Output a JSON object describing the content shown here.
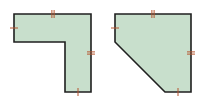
{
  "diagram": {
    "type": "geometry-figures",
    "colors": {
      "fill": "#c8dfcc",
      "stroke": "#1f1f1f",
      "tick": "#b5552e",
      "background": "#ffffff"
    },
    "shapes": [
      {
        "name": "l-shape",
        "points": [
          [
            14,
            14
          ],
          [
            91,
            14
          ],
          [
            91,
            92
          ],
          [
            65,
            92
          ],
          [
            65,
            42
          ],
          [
            14,
            42
          ]
        ],
        "ticks": [
          {
            "edge": "left",
            "count": 1,
            "x": 14,
            "y": 28,
            "orientation": "horizontal"
          },
          {
            "edge": "top",
            "count": 2,
            "x": 53,
            "y": 14,
            "orientation": "vertical"
          },
          {
            "edge": "right",
            "count": 2,
            "x": 91,
            "y": 53,
            "orientation": "horizontal"
          },
          {
            "edge": "bottom",
            "count": 1,
            "x": 78,
            "y": 92,
            "orientation": "vertical"
          }
        ]
      },
      {
        "name": "cut-corner-pentagon",
        "points": [
          [
            115,
            14
          ],
          [
            191,
            14
          ],
          [
            191,
            92
          ],
          [
            165,
            92
          ],
          [
            115,
            42
          ]
        ],
        "ticks": [
          {
            "edge": "left",
            "count": 1,
            "x": 115,
            "y": 28,
            "orientation": "horizontal"
          },
          {
            "edge": "top",
            "count": 2,
            "x": 153,
            "y": 14,
            "orientation": "vertical"
          },
          {
            "edge": "right",
            "count": 2,
            "x": 191,
            "y": 53,
            "orientation": "horizontal"
          },
          {
            "edge": "bottom",
            "count": 1,
            "x": 178,
            "y": 92,
            "orientation": "vertical"
          }
        ]
      }
    ]
  }
}
